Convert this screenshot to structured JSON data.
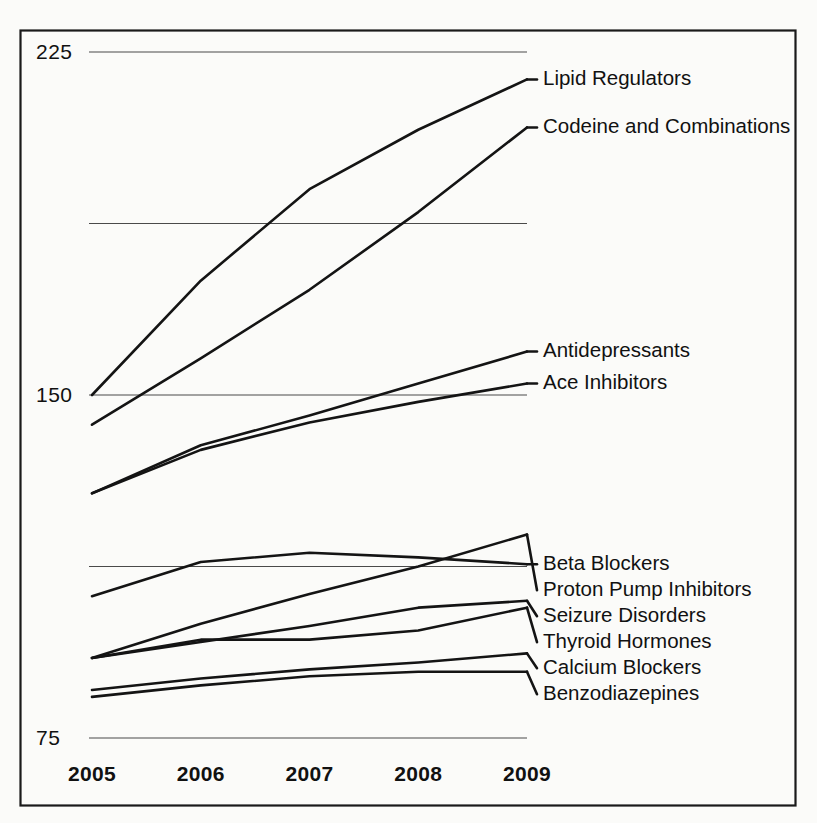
{
  "chart_data": {
    "type": "line",
    "title": "",
    "subtitle": "",
    "xlabel": "",
    "ylabel": "",
    "x": [
      "2005",
      "2006",
      "2007",
      "2008",
      "2009"
    ],
    "categories": [
      "2005",
      "2006",
      "2007",
      "2008",
      "2009"
    ],
    "ylim": [
      75,
      225
    ],
    "xlim": [
      "2005",
      "2009"
    ],
    "y_ticks_labeled": [
      "225",
      "150",
      "75"
    ],
    "y_gridlines": [
      225,
      187.5,
      150,
      112.5,
      75
    ],
    "grid": "horizontal",
    "legend_position": "right-inline-labels",
    "series": [
      {
        "name": "Lipid Regulators",
        "values": [
          150.0,
          175.0,
          195.0,
          208.0,
          219.0
        ],
        "label_x": "2009"
      },
      {
        "name": "Codeine and Combinations",
        "values": [
          143.5,
          158.0,
          173.0,
          190.0,
          208.5
        ],
        "label_x": "2009"
      },
      {
        "name": "Antidepressants",
        "values": [
          128.5,
          139.0,
          145.5,
          152.5,
          159.5
        ],
        "label_x": "2009"
      },
      {
        "name": "Ace Inhibitors",
        "values": [
          128.5,
          138.0,
          144.0,
          148.5,
          152.5
        ],
        "label_x": "2009"
      },
      {
        "name": "Beta Blockers",
        "values": [
          106.0,
          113.5,
          115.5,
          114.5,
          113.0
        ],
        "label_x": "2009"
      },
      {
        "name": "Proton Pump Inhibitors",
        "values": [
          92.5,
          100.0,
          106.5,
          112.5,
          119.5
        ],
        "label_x": "2009"
      },
      {
        "name": "Seizure Disorders",
        "values": [
          92.5,
          96.0,
          99.5,
          103.5,
          105.0
        ],
        "label_x": "2009"
      },
      {
        "name": "Thyroid Hormones",
        "values": [
          92.5,
          96.5,
          96.5,
          98.5,
          103.5
        ],
        "label_x": "2009"
      },
      {
        "name": "Calcium Blockers",
        "values": [
          85.5,
          88.0,
          90.0,
          91.5,
          93.5
        ],
        "label_x": "2009"
      },
      {
        "name": "Benzodiazepines",
        "values": [
          84.0,
          86.5,
          88.5,
          89.5,
          89.5
        ],
        "label_x": "2009"
      }
    ],
    "colors": {
      "line": "#141414",
      "grid": "#4a4a4a",
      "frame": "#1a1a1a",
      "text": "#111111",
      "background": "#fbfbf9"
    }
  },
  "axes": {
    "y_tick_labels": [
      {
        "text": "225",
        "value": 225
      },
      {
        "text": "150",
        "value": 150
      },
      {
        "text": "75",
        "value": 75
      }
    ],
    "x_tick_labels": [
      {
        "text": "2005"
      },
      {
        "text": "2006"
      },
      {
        "text": "2007"
      },
      {
        "text": "2008"
      },
      {
        "text": "2009"
      }
    ]
  },
  "series_labels": [
    {
      "text": "Lipid Regulators"
    },
    {
      "text": "Codeine and Combinations"
    },
    {
      "text": "Antidepressants"
    },
    {
      "text": "Ace Inhibitors"
    },
    {
      "text": "Beta Blockers"
    },
    {
      "text": "Proton Pump Inhibitors"
    },
    {
      "text": "Seizure Disorders"
    },
    {
      "text": "Thyroid Hormones"
    },
    {
      "text": "Calcium Blockers"
    },
    {
      "text": "Benzodiazepines"
    }
  ]
}
